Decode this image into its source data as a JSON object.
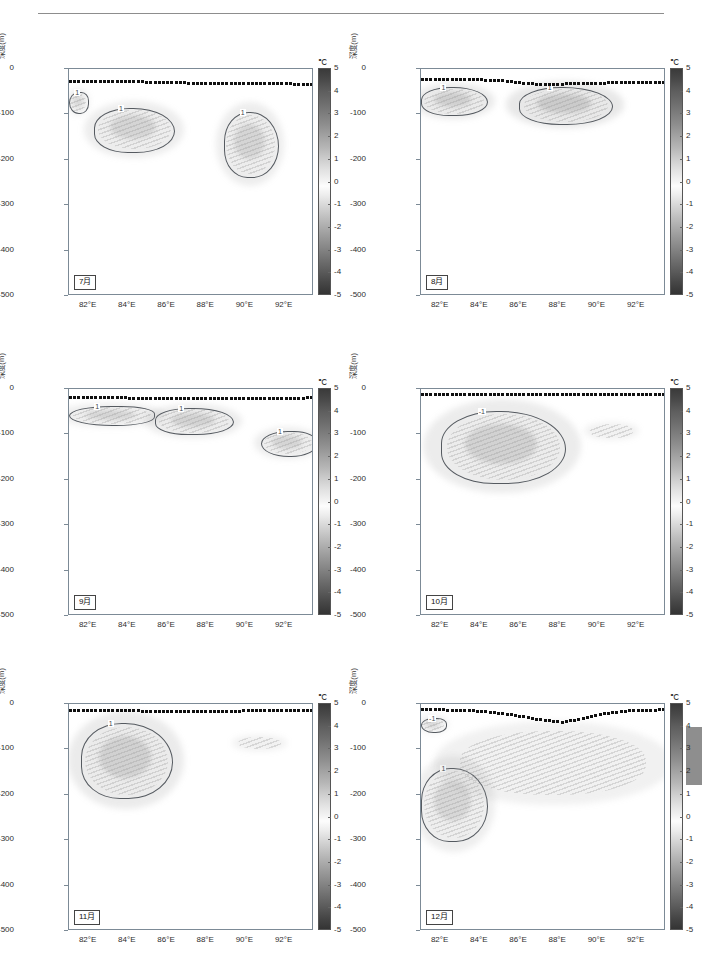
{
  "figure": {
    "unit_label": "℃",
    "y_axis_label": "深度(m)",
    "y_ticks": [
      "0",
      "-100",
      "-200",
      "-300",
      "-400",
      "-500"
    ],
    "x_ticks": [
      "82°E",
      "84°E",
      "86°E",
      "88°E",
      "90°E",
      "92°E"
    ],
    "colorbar_ticks": [
      "5",
      "4",
      "3",
      "2",
      "1",
      "0",
      "-1",
      "-2",
      "-3",
      "-4",
      "-5"
    ],
    "contour_label": "1",
    "contour_label_neg": "-1"
  },
  "panels": [
    {
      "month": "7月"
    },
    {
      "month": "8月"
    },
    {
      "month": "9月"
    },
    {
      "month": "10月"
    },
    {
      "month": "11月"
    },
    {
      "month": "12月"
    }
  ],
  "chart_data": {
    "type": "heatmap",
    "title": "",
    "xlabel": "",
    "ylabel": "深度(m)",
    "unit": "℃",
    "xlim": [
      81.0,
      93.5
    ],
    "ylim": [
      -500,
      0
    ],
    "zlim": [
      -5,
      5
    ],
    "colorbar_ticks": [
      5,
      4,
      3,
      2,
      1,
      0,
      -1,
      -2,
      -3,
      -4,
      -5
    ],
    "x_tick_values": [
      82,
      84,
      86,
      88,
      90,
      92
    ],
    "y_tick_values": [
      0,
      -100,
      -200,
      -300,
      -400,
      -500
    ],
    "grid": false,
    "legend": "colorbar-right",
    "overlay_series": {
      "name": "mixed-layer-depth",
      "style": "black-dotted-line"
    },
    "panels": [
      {
        "month": "7月",
        "mld_depth_m": -25,
        "mld_profile": [
          -27,
          -27,
          -28,
          -28,
          -29,
          -30,
          -31,
          -31,
          -32,
          -32,
          -33,
          -33,
          -34
        ],
        "features": [
          {
            "label": "1",
            "type": "closed-contour",
            "lon_range": [
              82.3,
              86.3
            ],
            "depth_range": [
              -180,
              -85
            ],
            "center": [
              84.2,
              -130
            ],
            "peak_value": 1.6
          },
          {
            "label": "1",
            "type": "closed-contour",
            "lon_range": [
              88.9,
              91.6
            ],
            "depth_range": [
              -235,
              -95
            ],
            "center": [
              90.2,
              -165
            ],
            "peak_value": 1.4
          },
          {
            "label": "1",
            "type": "edge-contour",
            "lon_range": [
              81.0,
              81.9
            ],
            "depth_range": [
              -95,
              -50
            ],
            "center": [
              81.4,
              -72
            ],
            "peak_value": 1.2
          }
        ]
      },
      {
        "month": "8月",
        "mld_depth_m": -22,
        "mld_profile": [
          -23,
          -23,
          -24,
          -24,
          -26,
          -31,
          -34,
          -33,
          -32,
          -31,
          -30,
          -30,
          -30
        ],
        "features": [
          {
            "label": "1",
            "type": "closed-contour",
            "lon_range": [
              81.0,
              84.3
            ],
            "depth_range": [
              -100,
              -40
            ],
            "center": [
              82.3,
              -68
            ],
            "peak_value": 2.2
          },
          {
            "label": "1",
            "type": "closed-contour",
            "lon_range": [
              86.0,
              90.7
            ],
            "depth_range": [
              -118,
              -40
            ],
            "center": [
              88.6,
              -75
            ],
            "peak_value": 2.6
          }
        ]
      },
      {
        "month": "9月",
        "mld_depth_m": -18,
        "mld_profile": [
          -19,
          -19,
          -19,
          -20,
          -20,
          -20,
          -20,
          -21,
          -21,
          -22,
          -22,
          -21,
          -19
        ],
        "features": [
          {
            "label": "1",
            "type": "edge-contour",
            "lon_range": [
              81.0,
              85.3
            ],
            "depth_range": [
              -78,
              -38
            ],
            "center": [
              82.6,
              -58
            ],
            "peak_value": 1.5
          },
          {
            "label": "1",
            "type": "closed-contour",
            "lon_range": [
              85.4,
              89.3
            ],
            "depth_range": [
              -98,
              -42
            ],
            "center": [
              87.2,
              -68
            ],
            "peak_value": 1.8
          },
          {
            "label": "1",
            "type": "edge-contour",
            "lon_range": [
              90.8,
              93.5
            ],
            "depth_range": [
              -145,
              -92
            ],
            "center": [
              92.2,
              -118
            ],
            "peak_value": 1.6
          }
        ]
      },
      {
        "month": "10月",
        "mld_depth_m": -12,
        "mld_profile": [
          -12,
          -12,
          -12,
          -12,
          -13,
          -13,
          -13,
          -13,
          -13,
          -13,
          -13,
          -12,
          -12
        ],
        "features": [
          {
            "label": "-1",
            "type": "closed-contour",
            "lon_range": [
              82.0,
              88.3
            ],
            "depth_range": [
              -205,
              -48
            ],
            "center": [
              84.8,
              -125
            ],
            "peak_value": -1.8
          },
          {
            "label": "faint",
            "type": "diffuse",
            "lon_range": [
              89.6,
              91.8
            ],
            "depth_range": [
              -108,
              -78
            ],
            "center": [
              90.6,
              -92
            ],
            "peak_value": 0.6
          }
        ]
      },
      {
        "month": "11月",
        "mld_depth_m": -14,
        "mld_profile": [
          -14,
          -14,
          -15,
          -15,
          -16,
          -17,
          -17,
          -17,
          -16,
          -15,
          -15,
          -14,
          -14
        ],
        "features": [
          {
            "label": "1",
            "type": "closed-contour",
            "lon_range": [
              81.6,
              86.2
            ],
            "depth_range": [
              -205,
              -42
            ],
            "center": [
              83.6,
              -115
            ],
            "peak_value": 1.9
          },
          {
            "label": "faint",
            "type": "diffuse",
            "lon_range": [
              89.6,
              91.8
            ],
            "depth_range": [
              -100,
              -72
            ],
            "center": [
              90.6,
              -86
            ],
            "peak_value": 0.6
          }
        ]
      },
      {
        "month": "12月",
        "mld_depth_m": -14,
        "mld_profile": [
          -13,
          -13,
          -14,
          -16,
          -21,
          -28,
          -36,
          -40,
          -33,
          -22,
          -16,
          -14,
          -13
        ],
        "features": [
          {
            "label": "-1",
            "type": "edge-contour",
            "lon_range": [
              81.0,
              82.2
            ],
            "depth_range": [
              -60,
              -30
            ],
            "center": [
              81.4,
              -45
            ],
            "peak_value": -1.2
          },
          {
            "label": "1",
            "type": "closed-contour",
            "lon_range": [
              81.0,
              84.3
            ],
            "depth_range": [
              -300,
              -140
            ],
            "center": [
              82.6,
              -225
            ],
            "peak_value": 1.3
          },
          {
            "label": "faint",
            "type": "diffuse",
            "lon_range": [
              83.0,
              92.5
            ],
            "depth_range": [
              -200,
              -60
            ],
            "center": [
              87.5,
              -120
            ],
            "peak_value": 0.7
          }
        ]
      }
    ]
  }
}
